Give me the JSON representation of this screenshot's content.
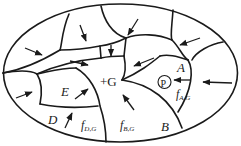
{
  "diagram": {
    "type": "partition-of-ellipse",
    "colors": {
      "stroke": "#1a1a1a",
      "background": "#ffffff"
    },
    "regions": [
      {
        "id": "G",
        "label": "+G"
      },
      {
        "id": "A",
        "label": "A"
      },
      {
        "id": "B",
        "label": "B"
      },
      {
        "id": "D",
        "label": "D"
      },
      {
        "id": "E",
        "label": "E"
      }
    ],
    "point": {
      "label": "P"
    },
    "flux_labels": [
      {
        "id": "fAG",
        "main": "f",
        "sub": "A,G"
      },
      {
        "id": "fBG",
        "main": "f",
        "sub": "B,G"
      },
      {
        "id": "fDG",
        "main": "f",
        "sub": "D,G"
      }
    ]
  }
}
